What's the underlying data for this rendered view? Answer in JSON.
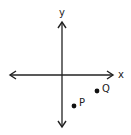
{
  "diagram": {
    "type": "coordinate-plane",
    "background": "#ffffff",
    "stroke_color": "#222222",
    "axes": {
      "x_label": "x",
      "y_label": "y",
      "origin_px": [
        62,
        75
      ]
    },
    "points": [
      {
        "label": "P",
        "px": [
          74,
          106
        ],
        "quadrant": "IV"
      },
      {
        "label": "Q",
        "px": [
          97,
          91
        ],
        "quadrant": "IV"
      }
    ]
  }
}
